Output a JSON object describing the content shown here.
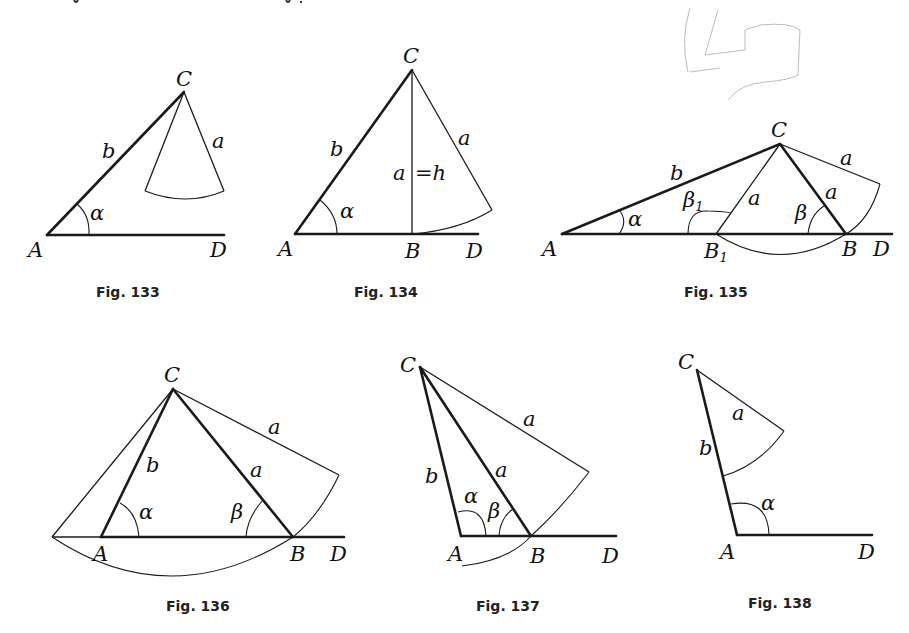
{
  "points": {
    "A": "A",
    "B": "B",
    "B1": "B",
    "B1_sub": "1",
    "C": "C",
    "D": "D"
  },
  "sides": {
    "a": "a",
    "b": "b",
    "h_eq": "=h"
  },
  "angles": {
    "alpha": "α",
    "beta": "β",
    "beta1": "β",
    "beta1_sub": "1"
  },
  "figures": [
    {
      "id": "fig133",
      "caption": "Fig. 133"
    },
    {
      "id": "fig134",
      "caption": "Fig. 134"
    },
    {
      "id": "fig135",
      "caption": "Fig. 135"
    },
    {
      "id": "fig136",
      "caption": "Fig. 136"
    },
    {
      "id": "fig137",
      "caption": "Fig. 137"
    },
    {
      "id": "fig138",
      "caption": "Fig. 138"
    }
  ]
}
